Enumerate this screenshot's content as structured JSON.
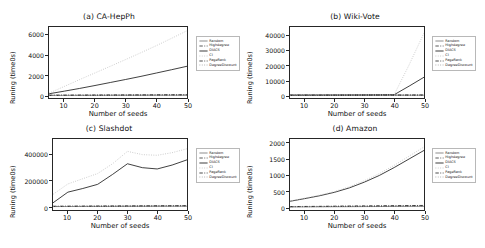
{
  "figure": {
    "background": "#ffffff",
    "xlabel": "Number of seeds",
    "ylabel": "Runing (time0s)"
  },
  "series_style": {
    "Random": {
      "color": "#7a7a7a",
      "dash": "none"
    },
    "Highdegree": {
      "color": "#3c3c3c",
      "dash": "dashdot"
    },
    "DIACS": {
      "color": "#1a1a1a",
      "dash": "solid"
    },
    "CI": {
      "color": "#bdbdbd",
      "dash": "dotted"
    },
    "PageRank": {
      "color": "#2b2b2b",
      "dash": "dashdot"
    },
    "DegreeDiscount": {
      "color": "#9e9e9e",
      "dash": "dotted"
    }
  },
  "legend": {
    "entries": [
      {
        "label": "Random"
      },
      {
        "label": "Highdegree"
      },
      {
        "label": "DIACS"
      },
      {
        "label": "CI"
      },
      {
        "label": "PageRank"
      },
      {
        "label": "DegreeDiscount"
      }
    ]
  },
  "chart_data": [
    {
      "type": "line",
      "title": "(a) CA-HepPh",
      "xlabel": "Number of seeds",
      "ylabel": "Runing (time0s)",
      "xlim": [
        5,
        50
      ],
      "ylim": [
        -250,
        6800
      ],
      "xticks": [
        10,
        20,
        30,
        40,
        50
      ],
      "yticks": [
        0,
        2000,
        4000,
        6000
      ],
      "grid": false,
      "x": [
        5,
        10,
        15,
        20,
        25,
        30,
        35,
        40,
        45,
        50
      ],
      "series": [
        {
          "name": "Random",
          "values": [
            10,
            12,
            14,
            16,
            18,
            20,
            22,
            24,
            26,
            28
          ]
        },
        {
          "name": "Highdegree",
          "values": [
            16,
            20,
            24,
            28,
            32,
            36,
            40,
            44,
            48,
            52
          ]
        },
        {
          "name": "DIACS",
          "values": [
            170,
            430,
            700,
            990,
            1290,
            1590,
            1900,
            2230,
            2560,
            2900
          ]
        },
        {
          "name": "CI",
          "values": [
            230,
            900,
            1580,
            2240,
            2900,
            3570,
            4250,
            4950,
            5680,
            6430
          ]
        },
        {
          "name": "PageRank",
          "values": [
            22,
            28,
            34,
            40,
            46,
            52,
            58,
            64,
            70,
            76
          ]
        },
        {
          "name": "DegreeDiscount",
          "values": [
            14,
            17,
            20,
            23,
            26,
            29,
            32,
            35,
            38,
            41
          ]
        }
      ]
    },
    {
      "type": "line",
      "title": "(b) Wiki-Vote",
      "xlabel": "Number of seeds",
      "ylabel": "Runing (time0s)",
      "xlim": [
        5,
        50
      ],
      "ylim": [
        -1800,
        46000
      ],
      "xticks": [
        10,
        20,
        30,
        40,
        50
      ],
      "yticks": [
        0,
        10000,
        20000,
        30000,
        40000
      ],
      "grid": false,
      "x": [
        5,
        10,
        15,
        20,
        25,
        30,
        35,
        40,
        45,
        50
      ],
      "series": [
        {
          "name": "Random",
          "values": [
            40,
            45,
            50,
            55,
            60,
            65,
            70,
            75,
            80,
            85
          ]
        },
        {
          "name": "Highdegree",
          "values": [
            60,
            70,
            80,
            90,
            100,
            110,
            120,
            130,
            140,
            150
          ]
        },
        {
          "name": "DIACS",
          "values": [
            120,
            150,
            180,
            210,
            250,
            300,
            360,
            430,
            6200,
            12200
          ]
        },
        {
          "name": "CI",
          "values": [
            150,
            190,
            230,
            280,
            330,
            390,
            460,
            540,
            20500,
            42000
          ]
        },
        {
          "name": "PageRank",
          "values": [
            80,
            95,
            110,
            125,
            140,
            155,
            170,
            185,
            200,
            215
          ]
        },
        {
          "name": "DegreeDiscount",
          "values": [
            50,
            58,
            66,
            74,
            82,
            90,
            98,
            106,
            114,
            122
          ]
        }
      ]
    },
    {
      "type": "line",
      "title": "(c) Slashdot",
      "xlabel": "Number of seeds",
      "ylabel": "Runing (time0s)",
      "xlim": [
        5,
        50
      ],
      "ylim": [
        -25000,
        520000
      ],
      "xticks": [
        10,
        20,
        30,
        40,
        50
      ],
      "yticks": [
        0,
        200000,
        400000
      ],
      "grid": false,
      "x": [
        5,
        10,
        15,
        20,
        25,
        30,
        35,
        40,
        45,
        50
      ],
      "series": [
        {
          "name": "Random",
          "values": [
            1500,
            1800,
            2100,
            2400,
            2700,
            3000,
            3300,
            3600,
            3900,
            4200
          ]
        },
        {
          "name": "Highdegree",
          "values": [
            2500,
            3000,
            3500,
            4000,
            4500,
            5000,
            5500,
            6000,
            6500,
            7000
          ]
        },
        {
          "name": "DIACS",
          "values": [
            30000,
            112000,
            140000,
            172000,
            248000,
            330000,
            300000,
            290000,
            320000,
            360000
          ]
        },
        {
          "name": "CI",
          "values": [
            95000,
            175000,
            215000,
            255000,
            330000,
            425000,
            400000,
            395000,
            415000,
            445000
          ]
        },
        {
          "name": "PageRank",
          "values": [
            3500,
            4000,
            4500,
            5000,
            5500,
            6000,
            6500,
            7000,
            7500,
            8000
          ]
        },
        {
          "name": "DegreeDiscount",
          "values": [
            2000,
            2300,
            2600,
            2900,
            3200,
            3500,
            3800,
            4100,
            4400,
            4700
          ]
        }
      ]
    },
    {
      "type": "line",
      "title": "(d) Amazon",
      "xlabel": "Number of seeds",
      "ylabel": "Runing (time0s)",
      "xlim": [
        5,
        50
      ],
      "ylim": [
        -90,
        2150
      ],
      "xticks": [
        10,
        20,
        30,
        40,
        50
      ],
      "yticks": [
        0,
        500,
        1000,
        1500,
        2000
      ],
      "grid": false,
      "x": [
        5,
        10,
        15,
        20,
        25,
        30,
        35,
        40,
        45,
        50
      ],
      "series": [
        {
          "name": "Random",
          "values": [
            8,
            10,
            12,
            14,
            16,
            18,
            20,
            22,
            24,
            26
          ]
        },
        {
          "name": "Highdegree",
          "values": [
            14,
            17,
            20,
            23,
            26,
            29,
            32,
            35,
            38,
            41
          ]
        },
        {
          "name": "DIACS",
          "values": [
            185,
            270,
            360,
            470,
            610,
            790,
            1000,
            1250,
            1520,
            1790
          ]
        },
        {
          "name": "CI",
          "values": [
            195,
            285,
            380,
            495,
            645,
            835,
            1060,
            1320,
            1610,
            1900
          ]
        },
        {
          "name": "PageRank",
          "values": [
            18,
            22,
            26,
            30,
            34,
            38,
            42,
            46,
            50,
            54
          ]
        },
        {
          "name": "DegreeDiscount",
          "values": [
            10,
            12,
            14,
            16,
            18,
            20,
            22,
            24,
            26,
            28
          ]
        }
      ]
    }
  ]
}
